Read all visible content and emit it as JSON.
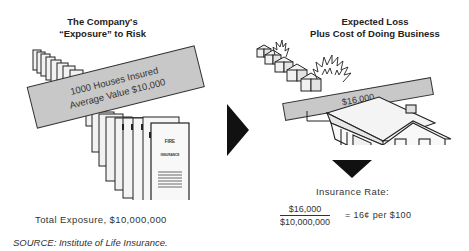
{
  "left_panel": {
    "title_line1": "The Company's",
    "title_line2": "“Exposure” to Risk",
    "banner_line1": "1000 Houses Insured",
    "banner_line2": "Average Value $10,000",
    "policy_label_1": "FIRE",
    "policy_label_2": "INSURANCE",
    "caption": "Total Exposure, $10,000,000"
  },
  "right_panel": {
    "title_line1": "Expected Loss",
    "title_line2": "Plus Cost of Doing Business",
    "banner": "$16,000",
    "rate_label": "Insurance Rate:",
    "numerator": "$16,000",
    "denominator": "$10,000,000",
    "result": "=  16¢ per $100"
  },
  "source": "SOURCE:  Institute of Life Insurance.",
  "colors": {
    "banner_fill": "#c8c8c8",
    "page_fill": "#f2f2f2",
    "arrow": "#111111",
    "outline": "#222222"
  }
}
